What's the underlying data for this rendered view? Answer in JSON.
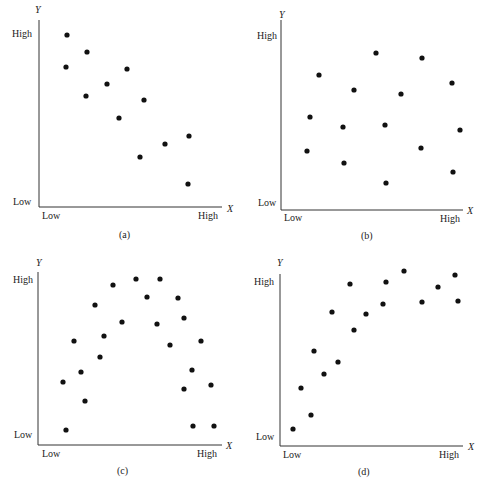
{
  "chart_data": [
    {
      "id": "a",
      "type": "scatter",
      "caption": "(a)",
      "title": "",
      "xlabel": "X",
      "ylabel": "Y",
      "x_ticks": [
        "Low",
        "High"
      ],
      "y_ticks": [
        "Low",
        "High"
      ],
      "description": "Negative correlation",
      "origin": [
        39,
        207
      ],
      "x_end": 222,
      "y_top": 20,
      "points": [
        [
          67,
          35
        ],
        [
          87,
          52
        ],
        [
          66,
          67
        ],
        [
          127,
          69
        ],
        [
          107,
          84
        ],
        [
          86,
          96
        ],
        [
          144,
          100
        ],
        [
          119,
          118
        ],
        [
          189,
          136
        ],
        [
          165,
          144
        ],
        [
          140,
          157
        ],
        [
          188,
          184
        ]
      ]
    },
    {
      "id": "b",
      "type": "scatter",
      "caption": "(b)",
      "title": "",
      "xlabel": "X",
      "ylabel": "Y",
      "x_ticks": [
        "Low",
        "High"
      ],
      "y_ticks": [
        "Low",
        "High"
      ],
      "description": "No correlation",
      "origin": [
        36,
        210
      ],
      "x_end": 218,
      "y_top": 20,
      "points": [
        [
          74,
          75
        ],
        [
          65,
          117
        ],
        [
          62,
          151
        ],
        [
          109,
          90
        ],
        [
          98,
          127
        ],
        [
          99,
          163
        ],
        [
          131,
          53
        ],
        [
          140,
          125
        ],
        [
          141,
          183
        ],
        [
          156,
          94
        ],
        [
          177,
          58
        ],
        [
          176,
          148
        ],
        [
          207,
          83
        ],
        [
          215,
          130
        ],
        [
          208,
          172
        ]
      ]
    },
    {
      "id": "c",
      "type": "scatter",
      "caption": "(c)",
      "title": "",
      "xlabel": "X",
      "ylabel": "Y",
      "x_ticks": [
        "Low",
        "High"
      ],
      "y_ticks": [
        "Low",
        "High"
      ],
      "description": "Curvilinear (inverted U) relationship",
      "origin": [
        38,
        201
      ],
      "x_end": 222,
      "y_top": 28,
      "points": [
        [
          63,
          138
        ],
        [
          66,
          186
        ],
        [
          74,
          97
        ],
        [
          81,
          128
        ],
        [
          85,
          157
        ],
        [
          95,
          61
        ],
        [
          100,
          113
        ],
        [
          104,
          92
        ],
        [
          113,
          41
        ],
        [
          122,
          78
        ],
        [
          136,
          35
        ],
        [
          147,
          53
        ],
        [
          160,
          35
        ],
        [
          157,
          80
        ],
        [
          170,
          101
        ],
        [
          178,
          54
        ],
        [
          184,
          74
        ],
        [
          184,
          145
        ],
        [
          192,
          126
        ],
        [
          201,
          97
        ],
        [
          193,
          182
        ],
        [
          211,
          141
        ],
        [
          214,
          182
        ]
      ]
    },
    {
      "id": "d",
      "type": "scatter",
      "caption": "(d)",
      "title": "",
      "xlabel": "X",
      "ylabel": "Y",
      "x_ticks": [
        "Low",
        "High"
      ],
      "y_ticks": [
        "Low",
        "High"
      ],
      "description": "Positive curvilinear relationship",
      "origin": [
        35,
        202
      ],
      "x_end": 218,
      "y_top": 30,
      "points": [
        [
          48,
          185
        ],
        [
          56,
          144
        ],
        [
          66,
          171
        ],
        [
          69,
          107
        ],
        [
          79,
          130
        ],
        [
          93,
          118
        ],
        [
          87,
          68
        ],
        [
          105,
          40
        ],
        [
          109,
          86
        ],
        [
          121,
          70
        ],
        [
          138,
          60
        ],
        [
          141,
          38
        ],
        [
          159,
          27
        ],
        [
          177,
          58
        ],
        [
          193,
          43
        ],
        [
          210,
          31
        ],
        [
          213,
          57
        ]
      ]
    }
  ],
  "style": {
    "point_color": "#111111",
    "axis_color": "#333333",
    "point_radius": 2.6
  }
}
